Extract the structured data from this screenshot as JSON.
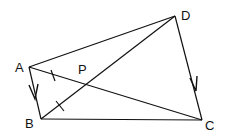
{
  "diagram": {
    "points": {
      "A": {
        "label": "A",
        "x": 29,
        "y": 67
      },
      "B": {
        "label": "B",
        "x": 41,
        "y": 119
      },
      "C": {
        "label": "C",
        "x": 202,
        "y": 120
      },
      "D": {
        "label": "D",
        "x": 175,
        "y": 16
      },
      "P": {
        "label": "P",
        "x": 86,
        "y": 86
      }
    },
    "segments": [
      "AB",
      "BC",
      "CD",
      "DA",
      "AC",
      "BD"
    ],
    "arrows": [
      "A→B",
      "D→C"
    ],
    "tick_marks": [
      "AP",
      "PB"
    ],
    "stroke_color": "#111111"
  }
}
